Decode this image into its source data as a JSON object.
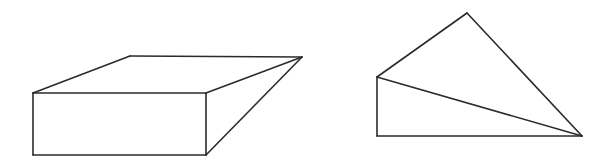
{
  "diagram": {
    "background": "#ffffff",
    "stroke_color": "#2b2b2b",
    "figures": [
      {
        "name": "wedge-box",
        "description": "Rectangular block with top face sloping to a single vertex (wedge / ramp solid)",
        "vertices": {
          "front_top_left": [
            33,
            93
          ],
          "front_top_right": [
            206,
            93
          ],
          "front_bottom_left": [
            33,
            155
          ],
          "front_bottom_right": [
            206,
            155
          ],
          "back_top_left": [
            130,
            56
          ],
          "apex_right": [
            302,
            57
          ]
        },
        "edges": [
          [
            "front_top_left",
            "front_top_right"
          ],
          [
            "front_top_right",
            "front_bottom_right"
          ],
          [
            "front_bottom_right",
            "front_bottom_left"
          ],
          [
            "front_bottom_left",
            "front_top_left"
          ],
          [
            "front_top_left",
            "back_top_left"
          ],
          [
            "back_top_left",
            "apex_right"
          ],
          [
            "front_top_right",
            "apex_right"
          ],
          [
            "front_bottom_right",
            "apex_right"
          ]
        ]
      },
      {
        "name": "tetrahedron-wedge",
        "description": "Solid with vertical left edge, horizontal base, two triangular faces meeting at right vertex",
        "vertices": {
          "apex_top": [
            467,
            13
          ],
          "left_upper": [
            377,
            77
          ],
          "left_bottom": [
            377,
            136
          ],
          "right": [
            582,
            136
          ]
        },
        "edges": [
          [
            "left_upper",
            "apex_top"
          ],
          [
            "apex_top",
            "right"
          ],
          [
            "left_upper",
            "right"
          ],
          [
            "left_upper",
            "left_bottom"
          ],
          [
            "left_bottom",
            "right"
          ]
        ]
      }
    ]
  }
}
